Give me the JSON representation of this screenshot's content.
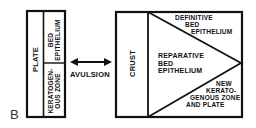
{
  "figure": {
    "letter": "B",
    "left_diagram": {
      "plate_label": "PLATE",
      "bed_epithelium_label": [
        "BED",
        "EPITHELIUM"
      ],
      "keratogenous_zone_label": [
        "KERATOGEN-",
        "OUS ZONE"
      ]
    },
    "arrow": {
      "type": "double-headed-arrow",
      "label": "AVULSION"
    },
    "right_diagram": {
      "crust_label": "CRUST",
      "definitive_label": [
        "DEFINITIVE",
        "BED",
        "EPITHELIUM"
      ],
      "reparative_label": [
        "REPARATIVE",
        "BED",
        "EPITHELIUM"
      ],
      "new_zone_label": [
        "NEW",
        "KERATO-",
        "GENOUS ZONE",
        "AND PLATE"
      ]
    },
    "colors": {
      "line": "#111111",
      "background": "#ffffff"
    }
  }
}
